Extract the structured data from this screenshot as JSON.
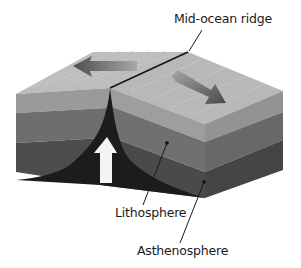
{
  "diagram": {
    "type": "plate-boundary-cross-section",
    "labels": {
      "ridge": "Mid-ocean ridge",
      "lithosphere": "Lithosphere",
      "asthenosphere": "Asthenosphere"
    },
    "arrows": {
      "left_plate": "spreading-left",
      "right_plate": "spreading-right",
      "upwelling": "magma-upwelling"
    },
    "colors": {
      "top_surface": "#bdbdbd",
      "top_surface_right": "#b8b8b8",
      "crust_layer": "#9a9a9a",
      "lithosphere_layer": "#6e6e6e",
      "asthenosphere_layer": "#4a4a4a",
      "rift": "#141414",
      "plate_arrow": "#5a5a5a",
      "upwelling_arrow": "#f4f4f4",
      "leader_line": "#1a1a1a"
    }
  }
}
